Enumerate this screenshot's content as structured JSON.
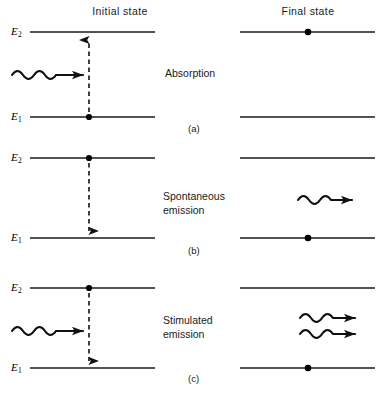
{
  "figure": {
    "headers": {
      "initial": "Initial state",
      "final": "Final state"
    },
    "level_labels": {
      "upper": "E",
      "upper_sub": "2",
      "lower": "E",
      "lower_sub": "1"
    },
    "line_color": "#1a1a1a",
    "dot_color": "#000000",
    "panels": [
      {
        "id": "a",
        "caption": "(a)",
        "process": "Absorption",
        "process_lines": [
          "Absorption"
        ],
        "transition_direction": "up",
        "initial_electron_level": "E1",
        "final_electron_level": "E2",
        "incoming_photons": 1,
        "outgoing_photons": 0
      },
      {
        "id": "b",
        "caption": "(b)",
        "process": "Spontaneous emission",
        "process_lines": [
          "Spontaneous",
          "emission"
        ],
        "transition_direction": "down",
        "initial_electron_level": "E2",
        "final_electron_level": "E1",
        "incoming_photons": 0,
        "outgoing_photons": 1
      },
      {
        "id": "c",
        "caption": "(c)",
        "process": "Stimulated emission",
        "process_lines": [
          "Stimulated",
          "emission"
        ],
        "transition_direction": "down",
        "initial_electron_level": "E2",
        "final_electron_level": "E1",
        "incoming_photons": 1,
        "outgoing_photons": 2
      }
    ]
  }
}
